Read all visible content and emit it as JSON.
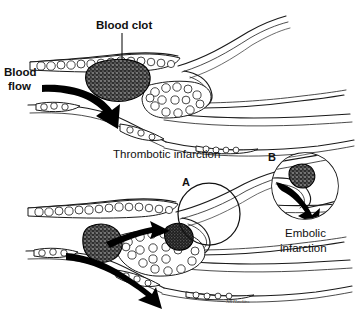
{
  "figure": {
    "background_color": "#ffffff",
    "ink_color": "#111111",
    "width": 358,
    "height": 322
  },
  "panels": [
    {
      "id": "thrombotic",
      "caption": "Thrombotic infarction",
      "labels": [
        {
          "name": "blood-clot",
          "text": "Blood clot"
        },
        {
          "name": "blood-flow",
          "text": "Blood flow"
        }
      ]
    },
    {
      "id": "embolic",
      "caption_line_1": "Embolic",
      "caption_line_2": "infarction",
      "markers": [
        {
          "name": "marker-a",
          "text": "A"
        },
        {
          "name": "marker-b",
          "text": "B"
        }
      ]
    }
  ],
  "labels": {
    "blood_clot": "Blood clot",
    "blood_flow_line_1": "Blood",
    "blood_flow_line_2": "flow",
    "thrombotic_caption": "Thrombotic infarction",
    "marker_a": "A",
    "marker_b": "B",
    "embolic_caption_line_1": "Embolic",
    "embolic_caption_line_2": "infarction",
    "signature": "NR Hawkins"
  },
  "colors": {
    "background": "#ffffff",
    "ink": "#111111",
    "vessel_stroke": "#1a1a1a",
    "lumen_stroke": "#3a3a3a",
    "clot_fill": "#2c2c2c",
    "arrow_fill": "#000000",
    "plaque_fill": "#ffffff"
  }
}
